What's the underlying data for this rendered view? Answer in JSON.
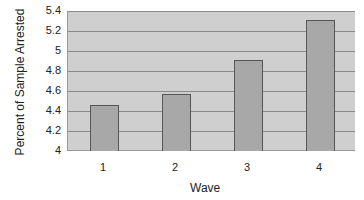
{
  "chart_data": {
    "type": "bar",
    "title": "",
    "xlabel": "Wave",
    "ylabel": "Percent of Sample Arrested",
    "categories": [
      "1",
      "2",
      "3",
      "4"
    ],
    "values": [
      4.46,
      4.57,
      4.91,
      5.31
    ],
    "ylim": [
      4,
      5.4
    ],
    "yticks": [
      "4",
      "4.2",
      "4.4",
      "4.6",
      "4.8",
      "5",
      "5.2",
      "5.4"
    ],
    "grid": true,
    "legend": "none",
    "colors": {
      "bar": "#a8a8a8",
      "plot_bg": "#cfcfcf",
      "grid": "#8a8a8a"
    }
  }
}
